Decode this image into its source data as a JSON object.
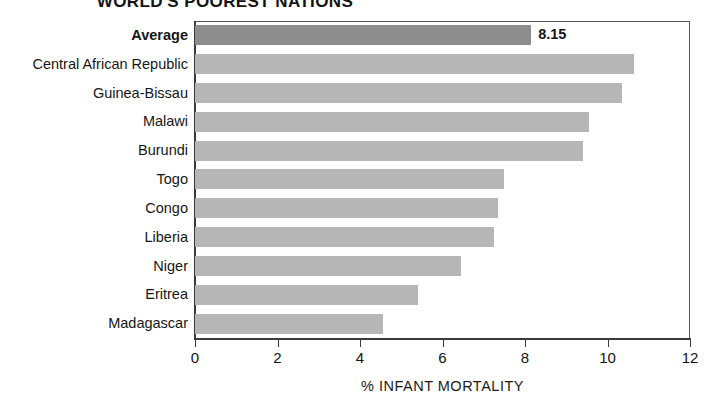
{
  "chart_data": {
    "type": "bar",
    "orientation": "horizontal",
    "title": "WORLD'S POOREST NATIONS",
    "xlabel": "% INFANT MORTALITY",
    "ylabel": "",
    "xlim": [
      0,
      12
    ],
    "xticks": [
      0,
      2,
      4,
      6,
      8,
      10,
      12
    ],
    "xtick_labels": [
      "0",
      "2",
      "4",
      "6",
      "8",
      "10",
      "12"
    ],
    "grid": false,
    "legend": null,
    "categories": [
      "Average",
      "Central African Republic",
      "Guinea-Bissau",
      "Malawi",
      "Burundi",
      "Togo",
      "Congo",
      "Liberia",
      "Niger",
      "Eritrea",
      "Madagascar"
    ],
    "values": [
      8.15,
      10.65,
      10.35,
      9.55,
      9.4,
      7.5,
      7.35,
      7.25,
      6.45,
      5.4,
      4.55
    ],
    "data_labels": [
      "8.15",
      "",
      "",
      "",
      "",
      "",
      "",
      "",
      "",
      "",
      ""
    ],
    "highlight_index": 0,
    "colors": {
      "bar": "#b6b6b6",
      "bar_highlight": "#8d8d8d",
      "axis": "#3a3a3a",
      "text": "#151515",
      "background": "#ffffff"
    }
  }
}
